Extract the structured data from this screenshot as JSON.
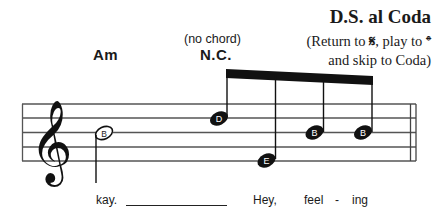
{
  "directions": {
    "title": "D.S. al Coda",
    "line1": "(Return to 𝄋, play to 𝄌",
    "line2": "and skip to Coda)"
  },
  "chords": [
    {
      "symbol": "Am",
      "annotation": ""
    },
    {
      "symbol": "N.C.",
      "annotation": "(no chord)"
    }
  ],
  "staff": {
    "clef": "treble",
    "barline_end": "double",
    "notes": [
      {
        "name": "B",
        "duration": "half",
        "position": "third line",
        "stem": "down"
      },
      {
        "name": "D",
        "duration": "eighth",
        "position": "fourth line",
        "stem": "up",
        "beamed": true
      },
      {
        "name": "E",
        "duration": "eighth",
        "position": "first line",
        "stem": "up",
        "beamed": true
      },
      {
        "name": "B",
        "duration": "eighth",
        "position": "third line",
        "stem": "up",
        "beamed": true
      },
      {
        "name": "B",
        "duration": "eighth",
        "position": "third line",
        "stem": "up",
        "beamed": true
      }
    ]
  },
  "lyrics": [
    {
      "text": "kay."
    },
    {
      "text": "Hey,"
    },
    {
      "text": "feel"
    },
    {
      "text": "-"
    },
    {
      "text": "ing"
    }
  ],
  "colors": {
    "ink": "#1a1a1a",
    "staff_line": "#555555",
    "background": "#ffffff"
  }
}
